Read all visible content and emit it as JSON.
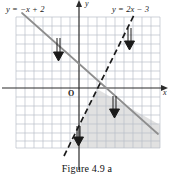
{
  "figure": {
    "caption": "Figure  4.9 a",
    "type": "coordinate-grid-inequality-graph"
  },
  "axes": {
    "x_label": "x",
    "y_label": "y",
    "origin_label": "O",
    "x_range": [
      -7,
      9
    ],
    "y_range": [
      -7,
      8
    ],
    "grid": true,
    "grid_cell_px": 9,
    "show_tick_numbers": false
  },
  "labels": {
    "solid_line": "y = −x + 2",
    "dashed_line": "y = 2x − 3"
  },
  "lines": [
    {
      "name": "line-solid",
      "equation": "y = -x + 2",
      "slope": -1,
      "intercept": 2,
      "style": "solid",
      "color": "#8e8e8e",
      "width": 1.6
    },
    {
      "name": "line-dashed",
      "equation": "y = 2x - 3",
      "slope": 2,
      "intercept": -3,
      "style": "dashed",
      "color": "#1a1a1a",
      "width": 1.8
    }
  ],
  "shading": {
    "name": "solution-region",
    "description": "region below both lines",
    "color": "#c9c9c9",
    "opacity": 0.55
  },
  "arrows": [
    {
      "name": "arrow-down-solid-upper-left",
      "x": 58,
      "y": 38,
      "length": 20,
      "direction": "down"
    },
    {
      "name": "arrow-down-dashed-upper-right",
      "x": 129,
      "y": 28,
      "length": 20,
      "direction": "down"
    },
    {
      "name": "arrow-down-solid-lower-right",
      "x": 114,
      "y": 96,
      "length": 20,
      "direction": "down"
    },
    {
      "name": "arrow-down-dashed-lower-left",
      "x": 78,
      "y": 128,
      "length": 20,
      "direction": "down"
    }
  ],
  "colors": {
    "grid_line": "#bfc4cf",
    "axis": "#2b2b2b",
    "shade": "#cccccc",
    "ink": "#1a1a1a"
  }
}
